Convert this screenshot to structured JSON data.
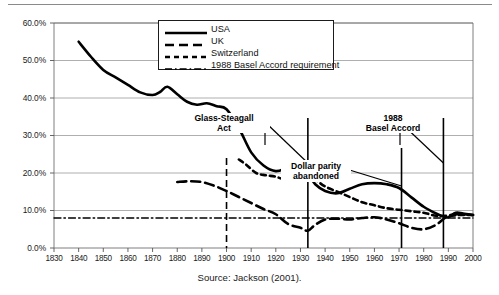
{
  "figure": {
    "source_note": "Source: Jackson (2001)."
  },
  "legend": {
    "position": "top-center-inside",
    "items": [
      {
        "label": "USA",
        "style": "solid-thick",
        "icon": "line-solid-icon"
      },
      {
        "label": "UK",
        "style": "long-dash",
        "icon": "line-longdash-icon"
      },
      {
        "label": "Switzerland",
        "style": "dashed",
        "icon": "line-dashed-icon"
      },
      {
        "label": "1988 Basel Accord requirement",
        "style": "dash-dot",
        "icon": "line-dashdot-icon"
      }
    ]
  },
  "annotations": [
    {
      "name": "glass-steagall",
      "lines": [
        "Glass-Steagall",
        "Act"
      ],
      "text": "Glass-Steagall Act",
      "x_pct": 37,
      "y_pct": 38
    },
    {
      "name": "dollar-parity",
      "lines": [
        "Dollar parity",
        "abandoned"
      ],
      "text": "Dollar parity abandoned",
      "x_pct": 60,
      "y_pct": 58
    },
    {
      "name": "basel-accord",
      "lines": [
        "1988",
        "Basel Accord"
      ],
      "text": "1988 Basel Accord",
      "x_pct": 82,
      "y_pct": 37
    }
  ],
  "chart_data": {
    "type": "line",
    "title": "",
    "xlabel": "",
    "ylabel": "",
    "xlim": [
      1830,
      2000
    ],
    "ylim": [
      0,
      60
    ],
    "ytick_labels": [
      "0.0%",
      "10.0%",
      "20.0%",
      "30.0%",
      "40.0%",
      "50.0%",
      "60.0%"
    ],
    "ytick_values": [
      0,
      10,
      20,
      30,
      40,
      50,
      60
    ],
    "xtick_labels": [
      "1830",
      "1840",
      "1850",
      "1860",
      "1870",
      "1880",
      "1890",
      "1900",
      "1910",
      "1920",
      "1930",
      "1940",
      "1950",
      "1960",
      "1970",
      "1980",
      "1990",
      "2000"
    ],
    "xtick_values": [
      1830,
      1840,
      1850,
      1860,
      1870,
      1880,
      1890,
      1900,
      1910,
      1920,
      1930,
      1940,
      1950,
      1960,
      1970,
      1980,
      1990,
      2000
    ],
    "grid": "horizontal",
    "legend_position": "upper center",
    "series": [
      {
        "name": "USA",
        "style": "solid-thick",
        "x": [
          1840,
          1845,
          1850,
          1855,
          1860,
          1865,
          1870,
          1873,
          1876,
          1880,
          1884,
          1888,
          1892,
          1896,
          1900,
          1905,
          1910,
          1915,
          1920,
          1925,
          1928,
          1930,
          1933,
          1936,
          1940,
          1945,
          1950,
          1955,
          1960,
          1965,
          1970,
          1975,
          1980,
          1985,
          1988,
          1990,
          1993,
          1996,
          2000
        ],
        "values": [
          55.0,
          51.0,
          47.5,
          45.5,
          43.5,
          41.5,
          40.8,
          41.6,
          43.0,
          41.0,
          39.0,
          38.2,
          38.6,
          37.8,
          37.0,
          32.0,
          25.5,
          22.0,
          20.5,
          21.4,
          21.2,
          20.8,
          19.8,
          17.0,
          15.2,
          14.6,
          15.8,
          17.0,
          17.3,
          17.0,
          16.0,
          13.5,
          11.0,
          9.2,
          8.4,
          8.2,
          9.4,
          9.2,
          8.8
        ]
      },
      {
        "name": "UK",
        "style": "long-dash",
        "x": [
          1880,
          1885,
          1890,
          1895,
          1900,
          1905,
          1910,
          1915,
          1920,
          1925,
          1930,
          1933,
          1936,
          1940,
          1945,
          1950,
          1955,
          1960,
          1965,
          1970,
          1975,
          1980,
          1985,
          1990,
          1995,
          2000
        ],
        "values": [
          17.6,
          17.8,
          17.6,
          16.6,
          15.2,
          13.6,
          12.0,
          10.4,
          9.0,
          6.4,
          5.4,
          4.6,
          6.2,
          7.6,
          7.8,
          7.6,
          8.0,
          8.2,
          7.6,
          6.6,
          5.4,
          5.0,
          6.2,
          8.6,
          9.0,
          8.8
        ]
      },
      {
        "name": "Switzerland",
        "style": "dashed",
        "x": [
          1905,
          1908,
          1912,
          1916,
          1920,
          1924,
          1928,
          1932,
          1936,
          1940,
          1945,
          1950,
          1955,
          1960,
          1965,
          1970,
          1975,
          1980,
          1985,
          1990,
          1995,
          2000
        ],
        "values": [
          23.6,
          22.2,
          20.0,
          19.4,
          19.0,
          18.2,
          18.6,
          19.4,
          18.2,
          16.4,
          15.0,
          13.6,
          12.2,
          11.4,
          10.6,
          10.2,
          9.8,
          9.4,
          8.6,
          8.6,
          8.8,
          8.8
        ]
      },
      {
        "name": "1988 Basel Accord requirement",
        "style": "dash-dot",
        "x": [
          1830,
          2000
        ],
        "values": [
          8.0,
          8.0
        ]
      }
    ],
    "event_markers": [
      {
        "name": "swiss-series-start",
        "x": 1900,
        "style": "dashed-vertical"
      },
      {
        "name": "glass-steagall-marker",
        "x": 1933,
        "style": "solid-vertical"
      },
      {
        "name": "dollar-parity-marker",
        "x": 1971,
        "style": "solid-vertical"
      },
      {
        "name": "basel-accord-marker",
        "x": 1988,
        "style": "solid-vertical"
      }
    ]
  }
}
